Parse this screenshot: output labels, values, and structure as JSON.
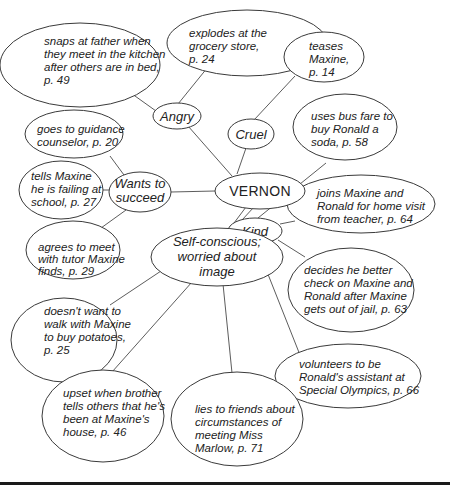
{
  "diagram": {
    "type": "character-web",
    "center": {
      "label": "VERNON"
    },
    "traits": [
      {
        "id": "angry",
        "label": "Angry"
      },
      {
        "id": "cruel",
        "label": "Cruel"
      },
      {
        "id": "wants",
        "label": [
          "Wants to",
          "succeed"
        ]
      },
      {
        "id": "kind",
        "label": "Kind"
      },
      {
        "id": "self",
        "label": [
          "Self-conscious;",
          "worried about",
          "image"
        ]
      }
    ],
    "details": {
      "snaps": [
        "snaps at father when",
        "they meet in the kitchen",
        "after others are in bed,",
        "p. 49"
      ],
      "explodes": [
        "explodes at the",
        "grocery store,",
        "p. 24"
      ],
      "teases": [
        "teases",
        "Maxine,",
        "p. 14"
      ],
      "bus": [
        "uses bus fare to",
        "buy Ronald a",
        "soda, p. 58"
      ],
      "guidance": [
        "goes to guidance",
        "counselor, p. 20"
      ],
      "failing": [
        "tells Maxine",
        "he is failing at",
        "school, p. 27"
      ],
      "tutor": [
        "agrees to meet",
        "with tutor Maxine",
        "finds, p. 29"
      ],
      "joins": [
        "joins Maxine and",
        "Ronald for home visit",
        "from teacher, p. 64"
      ],
      "decides": [
        "decides he better",
        "check on Maxine and",
        "Ronald after Maxine",
        "gets out of jail, p. 63"
      ],
      "potatoes": [
        "doesn't want to",
        "walk with Maxine",
        "to buy potatoes,",
        "p. 25"
      ],
      "volunteers": [
        "volunteers to be",
        "Ronald's assistant at",
        "Special Olympics, p. 66"
      ],
      "upset": [
        "upset when brother",
        "tells others that he's",
        "been at Maxine's",
        "house, p. 46"
      ],
      "lies": [
        "lies to friends about",
        "circumstances of",
        "meeting Miss",
        "Marlow, p. 71"
      ]
    },
    "connections": [
      [
        "VERNON",
        "Angry"
      ],
      [
        "VERNON",
        "Cruel"
      ],
      [
        "VERNON",
        "Wants to succeed"
      ],
      [
        "VERNON",
        "Kind"
      ],
      [
        "VERNON",
        "Self-conscious; worried about image"
      ],
      [
        "Angry",
        "snaps"
      ],
      [
        "Angry",
        "explodes"
      ],
      [
        "Cruel",
        "teases"
      ],
      [
        "Wants to succeed",
        "guidance"
      ],
      [
        "Wants to succeed",
        "failing"
      ],
      [
        "Wants to succeed",
        "tutor"
      ],
      [
        "Kind",
        "bus"
      ],
      [
        "Kind",
        "joins"
      ],
      [
        "Kind",
        "decides"
      ],
      [
        "Kind",
        "volunteers"
      ],
      [
        "Self-conscious; worried about image",
        "potatoes"
      ],
      [
        "Self-conscious; worried about image",
        "upset"
      ],
      [
        "Self-conscious; worried about image",
        "lies"
      ]
    ]
  }
}
